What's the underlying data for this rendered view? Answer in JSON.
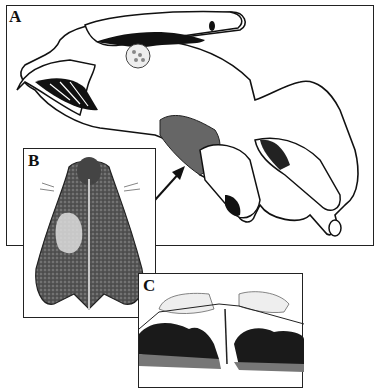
{
  "figure": {
    "panels": [
      {
        "id": "A",
        "label": "A",
        "description": "Line drawing of insect head with mouthparts in lateral view; arrow points to stippled region"
      },
      {
        "id": "B",
        "label": "B",
        "description": "Shaded illustration of a bilobed structure with textured surface and setae"
      },
      {
        "id": "C",
        "label": "C",
        "description": "Histological section showing dark tissue layers separated by a central cleft"
      }
    ],
    "colors": {
      "line": "#111111",
      "background": "#ffffff",
      "stipple": "#555555"
    }
  }
}
